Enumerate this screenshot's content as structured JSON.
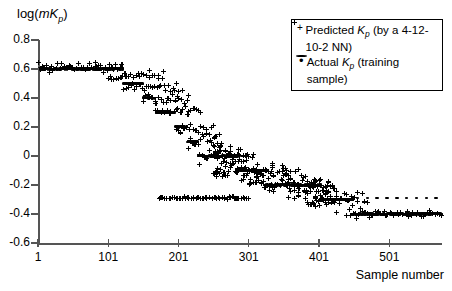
{
  "chart_data": {
    "type": "scatter",
    "title": "",
    "ylabel": "log(mKp)",
    "ylabel_parts": {
      "prefix": "log(",
      "italic_m": "m",
      "italic_K": "K",
      "sub_p": "p",
      "suffix": ")"
    },
    "xlabel": "Sample number",
    "ylim": [
      -0.6,
      0.8
    ],
    "xlim": [
      1,
      576
    ],
    "yticks": [
      0.8,
      0.6,
      0.4,
      0.2,
      0,
      -0.2,
      -0.4,
      -0.6
    ],
    "ytick_labels": [
      "0.8",
      "0.6",
      "0.4",
      "0.2",
      "0",
      "-0.2",
      "-0.4",
      "-0.6"
    ],
    "xticks": [
      1,
      101,
      201,
      301,
      401,
      501
    ],
    "xtick_labels": [
      "1",
      "101",
      "201",
      "301",
      "401",
      "501"
    ],
    "grid": false,
    "legend_position": "top-right",
    "series": [
      {
        "name": "Predicted Kp (by a 4-12-10-2 NN)",
        "marker": "plus",
        "color": "#000000",
        "legend_parts": {
          "pre": "Predicted ",
          "italic_K": "K",
          "sub_p": "p",
          "post": " (by a 4-12-10-2 NN)"
        }
      },
      {
        "name": "Actual Kp (training sample)",
        "marker": "dot",
        "color": "#000000",
        "legend_parts": {
          "pre": "Actual ",
          "italic_K": "K",
          "sub_p": "p",
          "post": " (training sample)"
        }
      }
    ],
    "actual_steps": [
      {
        "x_start": 1,
        "x_end": 122,
        "y": 0.6
      },
      {
        "x_start": 123,
        "x_end": 150,
        "y": 0.5
      },
      {
        "x_start": 151,
        "x_end": 168,
        "y": 0.4
      },
      {
        "x_start": 169,
        "x_end": 196,
        "y": 0.3
      },
      {
        "x_start": 197,
        "x_end": 213,
        "y": 0.2
      },
      {
        "x_start": 214,
        "x_end": 228,
        "y": 0.1
      },
      {
        "x_start": 229,
        "x_end": 288,
        "y": 0.0
      },
      {
        "x_start": 289,
        "x_end": 322,
        "y": -0.1
      },
      {
        "x_start": 323,
        "x_end": 404,
        "y": -0.2
      },
      {
        "x_start": 405,
        "x_end": 450,
        "y": -0.3
      },
      {
        "x_start": 451,
        "x_end": 576,
        "y": -0.4
      }
    ],
    "actual_sparse_series": {
      "y": -0.29,
      "x_start": 455,
      "x_end": 576,
      "spacing": 14,
      "note": "sparse dots above the -0.40 plateau on the right"
    },
    "predicted_bands": [
      {
        "x_start": 1,
        "x_end": 122,
        "y_center": 0.615,
        "spread": 0.055
      },
      {
        "x_start": 100,
        "x_end": 180,
        "y_center": 0.555,
        "spread": 0.045
      },
      {
        "x_start": 123,
        "x_end": 205,
        "y_center": 0.475,
        "spread": 0.04
      },
      {
        "x_start": 151,
        "x_end": 215,
        "y_center": 0.395,
        "spread": 0.045
      },
      {
        "x_start": 169,
        "x_end": 232,
        "y_center": 0.305,
        "spread": 0.045
      },
      {
        "x_start": 197,
        "x_end": 250,
        "y_center": 0.195,
        "spread": 0.06
      },
      {
        "x_start": 214,
        "x_end": 262,
        "y_center": 0.105,
        "spread": 0.06
      },
      {
        "x_start": 229,
        "x_end": 300,
        "y_center": 0.0,
        "spread": 0.07
      },
      {
        "x_start": 250,
        "x_end": 330,
        "y_center": -0.1,
        "spread": 0.08
      },
      {
        "x_start": 300,
        "x_end": 420,
        "y_center": -0.2,
        "spread": 0.075
      },
      {
        "x_start": 380,
        "x_end": 470,
        "y_center": -0.3,
        "spread": 0.07
      },
      {
        "x_start": 440,
        "x_end": 576,
        "y_center": -0.4,
        "spread": 0.04
      },
      {
        "x_start": 175,
        "x_end": 300,
        "y_center": -0.29,
        "spread": 0.012
      }
    ]
  }
}
